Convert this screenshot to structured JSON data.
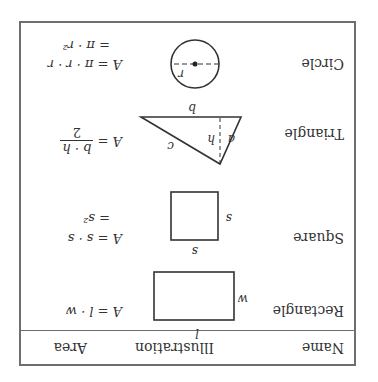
{
  "orientation": "rotated-180",
  "table": {
    "headers": {
      "name": "Name",
      "illustration": "Illustration",
      "area": "Area"
    },
    "rows": [
      {
        "name": "Rectangle",
        "labels": {
          "length": "l",
          "width": "w"
        },
        "formula_line1": "A = l · w"
      },
      {
        "name": "Square",
        "labels": {
          "side_top": "s",
          "side_right": "s"
        },
        "formula_line1": "A = s · s",
        "formula_line2": "= s²"
      },
      {
        "name": "Triangle",
        "labels": {
          "base": "b",
          "height": "h",
          "side_a": "a",
          "side_c": "c"
        },
        "formula_prefix": "A =",
        "formula_numerator": "b · h",
        "formula_denominator": "2"
      },
      {
        "name": "Circle",
        "labels": {
          "radius": "r"
        },
        "formula_line1": "A = π · r · r",
        "formula_line2": "= π · r²"
      }
    ]
  },
  "colors": {
    "border": "#6e6e6e",
    "ink": "#2a2a2a",
    "background": "#ffffff"
  }
}
